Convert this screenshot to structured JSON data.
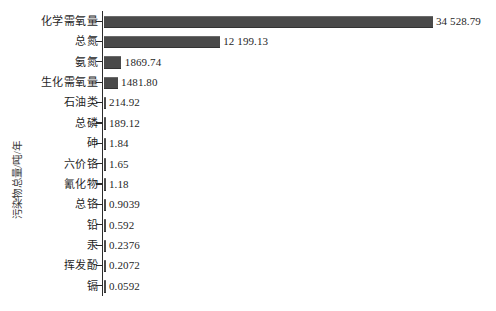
{
  "chart_data": {
    "type": "bar",
    "orientation": "horizontal",
    "title": "",
    "clipped_top_text": "",
    "xlabel": "",
    "ylabel": "污染物总量/吨/年",
    "xlim": [
      0,
      36000
    ],
    "grid": false,
    "legend": null,
    "bar_color": "#4a4a4a",
    "axis_color": "#2b2b2b",
    "background_color": "#ffffff",
    "categories": [
      "化学需氧量",
      "总氮",
      "氨氮",
      "生化需氧量",
      "石油类",
      "总磷",
      "砷",
      "六价铬",
      "氰化物",
      "总铬",
      "铅",
      "汞",
      "挥发酚",
      "镉"
    ],
    "values": [
      34528.79,
      12199.13,
      1869.74,
      1481.8,
      214.92,
      189.12,
      1.84,
      1.65,
      1.18,
      0.9039,
      0.592,
      0.2376,
      0.2072,
      0.0592
    ],
    "value_labels": [
      "34 528.79",
      "12 199.13",
      "1869.74",
      "1481.80",
      "214.92",
      "189.12",
      "1.84",
      "1.65",
      "1.18",
      "0.9039",
      "0.592",
      "0.2376",
      "0.2072",
      "0.0592"
    ]
  }
}
